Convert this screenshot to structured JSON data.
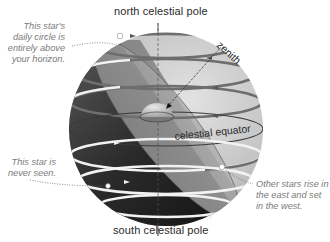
{
  "diagram": {
    "labels": {
      "north_pole": "north celestial pole",
      "south_pole": "south celestial pole",
      "zenith": "zenith",
      "equator": "celestial equator"
    },
    "annotations": {
      "circumpolar": "This star's daily circle is entirely above your horizon.",
      "never_seen": "This star is never seen.",
      "rise_set": "Other stars rise in the east and set in the west."
    },
    "colors": {
      "sphere_light": "#c9c9c9",
      "sphere_dark": "#2a2a2a",
      "horizon_plane": "#9a9a9a",
      "star_path_above": "#6e6e6e",
      "star_path_below": "#f2f2f2",
      "note_text": "#7a7a7a",
      "label_text": "#2b2b2b"
    }
  }
}
